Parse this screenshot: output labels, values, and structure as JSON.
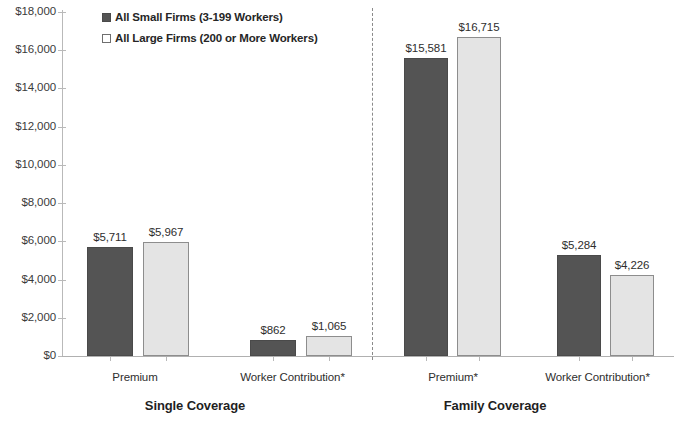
{
  "chart_data": {
    "type": "bar",
    "title": "",
    "subtitle": "",
    "xlabel": "",
    "ylabel": "",
    "ylim": [
      0,
      18000
    ],
    "ytick_labels": [
      "$18,000",
      "$16,000",
      "$14,000",
      "$12,000",
      "$10,000",
      "$8,000",
      "$6,000",
      "$4,000",
      "$2,000",
      "$0"
    ],
    "ytick_values": [
      18000,
      16000,
      14000,
      12000,
      10000,
      8000,
      6000,
      4000,
      2000,
      0
    ],
    "grid": false,
    "legend_position": "top-left",
    "categories": [
      "Premium",
      "Worker Contribution*",
      "Premium*",
      "Worker Contribution*"
    ],
    "groups": [
      {
        "name": "Single Coverage",
        "categories": [
          {
            "label": "Premium",
            "values": [
              5711,
              5967
            ],
            "value_labels": [
              "$5,711",
              "$5,967"
            ]
          },
          {
            "label": "Worker Contribution*",
            "values": [
              862,
              1065
            ],
            "value_labels": [
              "$862",
              "$1,065"
            ]
          }
        ]
      },
      {
        "name": "Family Coverage",
        "categories": [
          {
            "label": "Premium*",
            "values": [
              15581,
              16715
            ],
            "value_labels": [
              "$15,581",
              "$16,715"
            ]
          },
          {
            "label": "Worker Contribution*",
            "values": [
              5284,
              4226
            ],
            "value_labels": [
              "$5,284",
              "$4,226"
            ]
          }
        ]
      }
    ],
    "series": [
      {
        "name": "All Small Firms (3-199 Workers)",
        "color": "#545454",
        "values": [
          5711,
          862,
          15581,
          5284
        ]
      },
      {
        "name": "All Large Firms (200 or More Workers)",
        "color": "#e4e4e4",
        "values": [
          5967,
          1065,
          16715,
          4226
        ]
      }
    ]
  },
  "legend": {
    "items": [
      {
        "label": "All Small Firms (3-199 Workers)",
        "swatch": "dark"
      },
      {
        "label": "All Large Firms (200 or More Workers)",
        "swatch": "light"
      }
    ]
  },
  "axis": {
    "y_labels": [
      "$18,000",
      "$16,000",
      "$14,000",
      "$12,000",
      "$10,000",
      "$8,000",
      "$6,000",
      "$4,000",
      "$2,000",
      "$0"
    ]
  },
  "bars": [
    {
      "id": "single-premium-small",
      "value_label": "$5,711"
    },
    {
      "id": "single-premium-large",
      "value_label": "$5,967"
    },
    {
      "id": "single-contribution-small",
      "value_label": "$862"
    },
    {
      "id": "single-contribution-large",
      "value_label": "$1,065"
    },
    {
      "id": "family-premium-small",
      "value_label": "$15,581"
    },
    {
      "id": "family-premium-large",
      "value_label": "$16,715"
    },
    {
      "id": "family-contribution-small",
      "value_label": "$5,284"
    },
    {
      "id": "family-contribution-large",
      "value_label": "$4,226"
    }
  ],
  "category_labels": {
    "single_premium": "Premium",
    "single_contribution": "Worker Contribution*",
    "family_premium": "Premium*",
    "family_contribution": "Worker Contribution*"
  },
  "group_labels": {
    "single": "Single Coverage",
    "family": "Family Coverage"
  }
}
